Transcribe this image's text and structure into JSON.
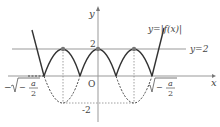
{
  "diagram": {
    "type": "function-graph",
    "axes": {
      "x_label": "x",
      "y_label": "y",
      "origin_label": "O"
    },
    "curve_label": "y=|f(x)|",
    "line_label": "y=2",
    "tick_labels": {
      "y_top": "2",
      "y_bottom": "-2",
      "x_left_prefix": "−",
      "x_left_inner": "−",
      "x_right_inner": "−",
      "frac_num": "a",
      "frac_den": "2"
    },
    "colors": {
      "curve": "#333333",
      "axis": "#888888",
      "dots": "#777777",
      "text": "#444444"
    }
  }
}
